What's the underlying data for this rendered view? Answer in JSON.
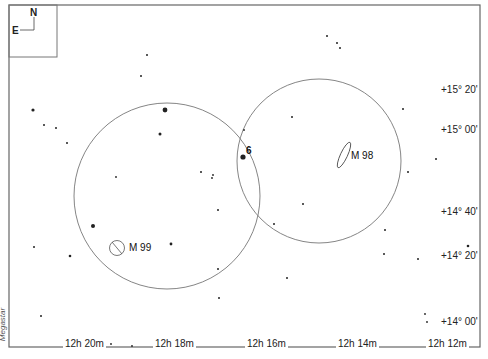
{
  "map": {
    "compass": {
      "north": "N",
      "east": "E"
    },
    "credit": "Megastar",
    "dec_labels": [
      {
        "text": "+15° 20'",
        "y": 90
      },
      {
        "text": "+15° 00'",
        "y": 130
      },
      {
        "text": "+14° 40'",
        "y": 212
      },
      {
        "text": "+14° 20'",
        "y": 254
      },
      {
        "text": "+14° 00'",
        "y": 318
      }
    ],
    "ra_labels": [
      {
        "text": "12h 20m",
        "x": 63
      },
      {
        "text": "12h 18m",
        "x": 153
      },
      {
        "text": "12h 16m",
        "x": 245
      },
      {
        "text": "12h 14m",
        "x": 336
      },
      {
        "text": "12h 12m",
        "x": 426
      }
    ],
    "objects": [
      {
        "name": "M 99",
        "type": "galaxy-face-on"
      },
      {
        "name": "M 98",
        "type": "galaxy-edge-on"
      },
      {
        "name": "6",
        "type": "star-label"
      }
    ],
    "fields_of_view": [
      {
        "cx": 167,
        "cy": 196,
        "r": 93
      },
      {
        "cx": 319,
        "cy": 161,
        "r": 82
      }
    ],
    "colors": {
      "border": "#555555",
      "circle": "#777777",
      "star": "#222222"
    }
  }
}
